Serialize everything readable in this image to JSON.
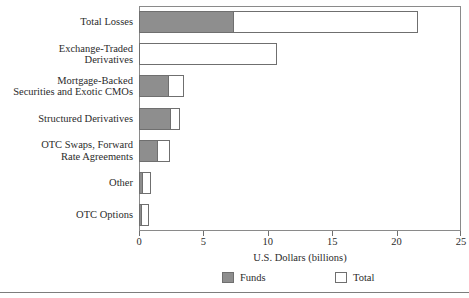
{
  "chart_data": {
    "type": "bar",
    "orientation": "horizontal",
    "title": "",
    "xlabel": "U.S. Dollars (billions)",
    "ylabel": "",
    "xlim": [
      0,
      25
    ],
    "xticks": [
      0,
      5,
      10,
      15,
      20,
      25
    ],
    "xtick_labels": [
      "0",
      "5",
      "10",
      "15",
      "20",
      "25"
    ],
    "grid": false,
    "legend_position": "bottom",
    "categories": [
      "Total Losses",
      "Exchange-Traded\nDerivatives",
      "Mortgage-Backed\nSecurities and Exotic CMOs",
      "Structured Derivatives",
      "OTC Swaps, Forward\nRate Agreements",
      "Other",
      "OTC Options"
    ],
    "series": [
      {
        "name": "Funds",
        "color": "#8e8e8e",
        "values": [
          7.4,
          0.0,
          2.3,
          2.5,
          1.5,
          0.3,
          0.2
        ]
      },
      {
        "name": "Total",
        "color": "#ffffff",
        "values": [
          21.7,
          10.7,
          3.5,
          3.2,
          2.4,
          0.9,
          0.8
        ]
      }
    ]
  },
  "legend": {
    "items": [
      {
        "label": "Funds",
        "swatch": "funds"
      },
      {
        "label": "Total",
        "swatch": "total"
      }
    ]
  },
  "axis": {
    "x_title": "U.S. Dollars (billions)"
  }
}
